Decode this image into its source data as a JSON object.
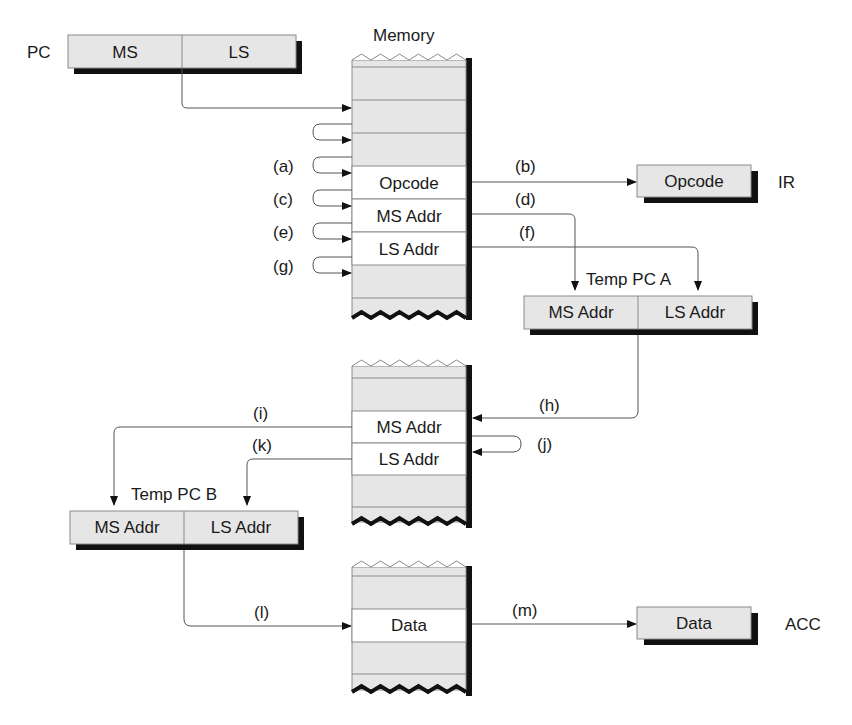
{
  "diagram": {
    "memory_title": "Memory",
    "pc": {
      "label": "PC",
      "fields": [
        "MS",
        "LS"
      ]
    },
    "ir": {
      "label": "IR",
      "field": "Opcode"
    },
    "temp_pc_a": {
      "label": "Temp PC A",
      "fields": [
        "MS Addr",
        "LS Addr"
      ]
    },
    "temp_pc_b": {
      "label": "Temp PC B",
      "fields": [
        "MS Addr",
        "LS Addr"
      ]
    },
    "acc": {
      "label": "ACC",
      "field": "Data"
    },
    "memory1": {
      "cells": [
        "Opcode",
        "MS Addr",
        "LS Addr"
      ]
    },
    "memory2": {
      "cells": [
        "MS Addr",
        "LS Addr"
      ]
    },
    "memory3": {
      "cells": [
        "Data"
      ]
    },
    "steps": {
      "a": "(a)",
      "b": "(b)",
      "c": "(c)",
      "d": "(d)",
      "e": "(e)",
      "f": "(f)",
      "g": "(g)",
      "h": "(h)",
      "i": "(i)",
      "j": "(j)",
      "k": "(k)",
      "l": "(l)",
      "m": "(m)"
    }
  }
}
